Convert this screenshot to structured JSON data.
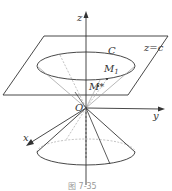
{
  "figure": {
    "caption": "图 7-35",
    "labels": {
      "z_axis": "z",
      "y_axis": "y",
      "x_axis": "x",
      "origin": "O",
      "plane": "z=c",
      "curve": "C",
      "point_m1": "M",
      "point_m1_sub": "1",
      "point_mstar": "M*"
    },
    "colors": {
      "line": "#333333",
      "dashed": "#888888",
      "background": "#ffffff"
    }
  }
}
